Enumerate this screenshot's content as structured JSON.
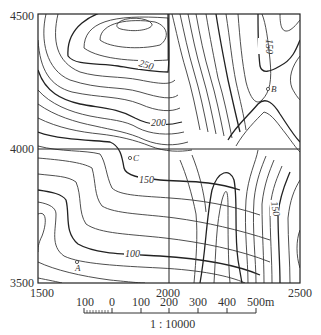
{
  "map": {
    "type": "topographic contour map",
    "y_axis": {
      "top": "4500",
      "middle": "4000",
      "bottom": "3500"
    },
    "x_axis": {
      "left": "1500",
      "middle": "2000",
      "right": "2500"
    },
    "contour_labels": [
      {
        "text": "250",
        "position": "upper-center"
      },
      {
        "text": "200",
        "position": "center-left of middle line"
      },
      {
        "text": "150",
        "position": "upper-right, vertical"
      },
      {
        "text": "150",
        "position": "center below C"
      },
      {
        "text": "150",
        "position": "lower-right, vertical"
      },
      {
        "text": "100",
        "position": "lower-left"
      }
    ],
    "points": [
      {
        "label": "A",
        "position": "lower-left"
      },
      {
        "label": "B",
        "position": "upper-right"
      },
      {
        "label": "C",
        "position": "center-left"
      }
    ]
  },
  "scale_bar": {
    "ticks": [
      "100",
      "0",
      "100",
      "200",
      "300",
      "400",
      "500m"
    ],
    "ratio": "1 : 10000"
  }
}
